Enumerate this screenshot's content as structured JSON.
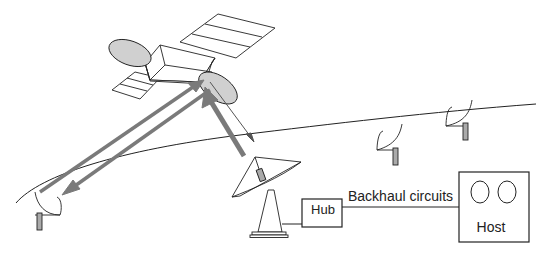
{
  "diagram": {
    "type": "satellite-network",
    "nodes": {
      "satellite": {
        "name": "Satellite"
      },
      "hub": {
        "label": "Hub"
      },
      "host": {
        "label": "Host"
      },
      "hub_antenna": {
        "name": "Hub earth station antenna"
      },
      "vsat_terminals": [
        {
          "name": "VSAT left"
        },
        {
          "name": "VSAT middle"
        },
        {
          "name": "VSAT right"
        }
      ]
    },
    "links": {
      "backhaul": {
        "label": "Backhaul circuits"
      }
    },
    "colors": {
      "line": "#222222",
      "arrow": "#7a7a7a",
      "reflector_fill": "#d0d0d0"
    }
  }
}
